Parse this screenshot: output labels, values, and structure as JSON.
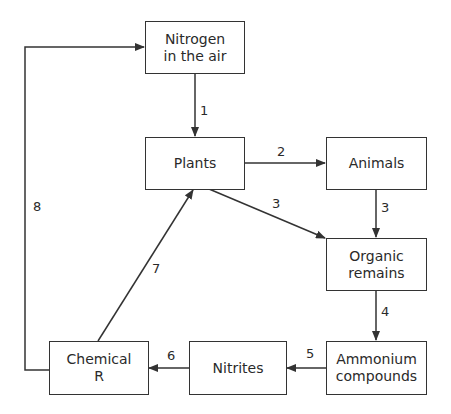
{
  "diagram": {
    "type": "flow",
    "nodes": [
      {
        "id": "nitrogen",
        "line1": "Nitrogen",
        "line2": "in the air"
      },
      {
        "id": "plants",
        "line1": "Plants",
        "line2": ""
      },
      {
        "id": "animals",
        "line1": "Animals",
        "line2": ""
      },
      {
        "id": "organic",
        "line1": "Organic",
        "line2": "remains"
      },
      {
        "id": "ammonium",
        "line1": "Ammonium",
        "line2": "compounds"
      },
      {
        "id": "nitrites",
        "line1": "Nitrites",
        "line2": ""
      },
      {
        "id": "chemical",
        "line1": "Chemical",
        "line2": "R"
      }
    ],
    "edges": [
      {
        "label": "1",
        "from": "nitrogen",
        "to": "plants"
      },
      {
        "label": "2",
        "from": "plants",
        "to": "animals"
      },
      {
        "label": "3",
        "from": "plants",
        "to": "organic"
      },
      {
        "label": "3",
        "from": "animals",
        "to": "organic"
      },
      {
        "label": "4",
        "from": "organic",
        "to": "ammonium"
      },
      {
        "label": "5",
        "from": "ammonium",
        "to": "nitrites"
      },
      {
        "label": "6",
        "from": "nitrites",
        "to": "chemical"
      },
      {
        "label": "7",
        "from": "chemical",
        "to": "plants"
      },
      {
        "label": "8",
        "from": "chemical",
        "to": "nitrogen"
      }
    ]
  },
  "colors": {
    "line": "#333333",
    "text": "#2a2a2a",
    "background": "#ffffff"
  }
}
